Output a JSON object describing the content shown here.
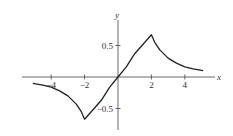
{
  "chart_data": {
    "type": "line",
    "title": "",
    "xlabel": "x",
    "ylabel": "y",
    "xlim": [
      -5.8,
      5.8
    ],
    "ylim": [
      -0.85,
      0.9
    ],
    "grid": false,
    "legend": null,
    "x_ticks": [
      -4,
      -2,
      2,
      4
    ],
    "x_tick_labels": [
      "-4",
      "-2",
      "2",
      "4"
    ],
    "y_ticks": [
      0.5,
      -0.5
    ],
    "y_tick_labels": [
      "0.5",
      "-0.5"
    ],
    "series": [
      {
        "name": "f(x)",
        "x": [
          -5.1,
          -4.5,
          -4,
          -3.5,
          -3,
          -2.5,
          -2.2,
          -2,
          -1.5,
          -1,
          -0.5,
          0,
          0.5,
          1,
          1.5,
          2,
          2.2,
          2.5,
          3,
          3.5,
          4,
          4.5,
          5.1
        ],
        "y": [
          -0.1,
          -0.13,
          -0.16,
          -0.22,
          -0.3,
          -0.43,
          -0.55,
          -0.67,
          -0.52,
          -0.37,
          -0.16,
          0,
          0.16,
          0.37,
          0.52,
          0.67,
          0.55,
          0.43,
          0.3,
          0.22,
          0.16,
          0.13,
          0.1
        ]
      }
    ],
    "annotations": []
  },
  "axes": {
    "x_label": "x",
    "y_label": "y",
    "x_ticks": [
      {
        "value": -4,
        "label": "-4"
      },
      {
        "value": -2,
        "label": "-2"
      },
      {
        "value": 2,
        "label": "2"
      },
      {
        "value": 4,
        "label": "4"
      }
    ],
    "y_ticks": [
      {
        "value": 0.5,
        "label": "0.5"
      },
      {
        "value": -0.5,
        "label": "-0.5"
      }
    ]
  }
}
